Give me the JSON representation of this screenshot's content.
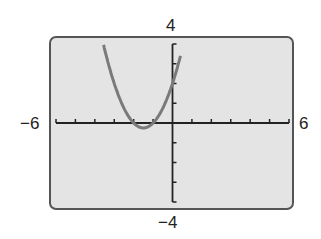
{
  "chart_data": {
    "type": "line",
    "title": "",
    "xlabel": "",
    "ylabel": "",
    "xlim": [
      -6,
      6
    ],
    "ylim": [
      -4,
      4
    ],
    "x_tick_step": 1,
    "y_tick_step": 1,
    "grid": false,
    "legend": null,
    "window_labels": {
      "xmin": "−6",
      "xmax": "6",
      "ymin": "−4",
      "ymax": "4"
    },
    "series": [
      {
        "name": "y = x^2 + 3x + 2",
        "color": "#808080",
        "x": [
          -3.5,
          -3,
          -2.5,
          -2,
          -1.5,
          -1,
          -0.5,
          0,
          0.4
        ],
        "y": [
          3.75,
          2,
          0.75,
          0,
          -0.25,
          0,
          0.75,
          2,
          3.36
        ]
      }
    ]
  },
  "labels": {
    "ymax": "4",
    "ymin": "−4",
    "xmin": "−6",
    "xmax": "6"
  },
  "colors": {
    "screen_bg": "#e4e4e4",
    "border": "#555555",
    "axis": "#222222",
    "curve": "#7a7a7a"
  }
}
